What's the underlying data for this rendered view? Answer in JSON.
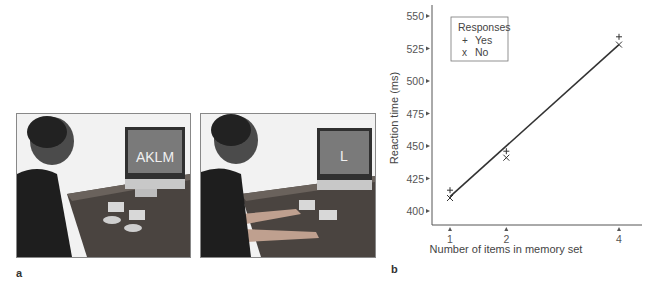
{
  "panels": {
    "a": {
      "label": "a",
      "photos": [
        {
          "screen_text": "AKLM",
          "description": "man seated facing monitor, hands at rest"
        },
        {
          "screen_text": "L",
          "description": "man seated facing monitor, hands on response buttons"
        }
      ]
    },
    "b": {
      "label": "b"
    }
  },
  "chart_data": {
    "type": "scatter",
    "title": "",
    "xlabel": "Number of items in memory set",
    "ylabel": "Reaction time (ms)",
    "x_ticks": [
      "1",
      "2",
      "4"
    ],
    "y_ticks": [
      "400",
      "425",
      "450",
      "475",
      "500",
      "525",
      "550"
    ],
    "ylim": [
      390,
      555
    ],
    "xlim": [
      0.5,
      4.5
    ],
    "grid": false,
    "legend": {
      "title": "Responses",
      "position": "upper-left",
      "entries": [
        {
          "marker": "+",
          "label": "Yes"
        },
        {
          "marker": "x",
          "label": "No"
        }
      ]
    },
    "series": [
      {
        "name": "Yes",
        "marker": "+",
        "x": [
          1,
          2,
          4
        ],
        "values": [
          416,
          446,
          534
        ]
      },
      {
        "name": "No",
        "marker": "x",
        "x": [
          1,
          2,
          4
        ],
        "values": [
          410,
          441,
          528
        ]
      }
    ],
    "fit_line": {
      "x": [
        1,
        4
      ],
      "y": [
        411,
        528
      ]
    }
  }
}
